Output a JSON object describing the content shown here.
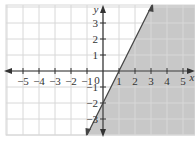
{
  "chart_data": {
    "type": "line",
    "title": "",
    "xlabel": "x",
    "ylabel": "y",
    "xlim": [
      -6,
      6
    ],
    "ylim": [
      -4,
      4
    ],
    "grid": true,
    "x_tick_labels": [
      "-5",
      "-4",
      "-3",
      "-2",
      "-1",
      "1",
      "2",
      "3",
      "4",
      "5"
    ],
    "y_tick_labels": [
      "3",
      "2",
      "1",
      "-1",
      "-2",
      "-3"
    ],
    "origin_label": "0",
    "boundary_line": {
      "equation": "y = 2x - 2",
      "style": "solid",
      "points": [
        [
          0,
          -2
        ],
        [
          1,
          0
        ],
        [
          2,
          2
        ],
        [
          3,
          4
        ]
      ]
    },
    "shaded_region": "y <= 2x - 2",
    "inequality": "y ≤ 2x − 2",
    "colors": {
      "shade": "#c8c8c8",
      "grid": "#d8d8d8",
      "axis": "#333333",
      "line": "#444444"
    }
  }
}
